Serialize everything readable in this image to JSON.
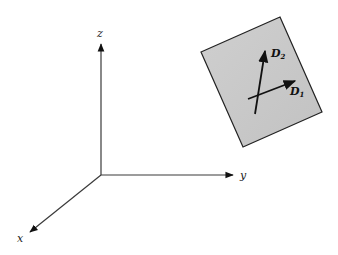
{
  "diagram": {
    "axes": {
      "x": {
        "label": "x"
      },
      "y": {
        "label": "y"
      },
      "z": {
        "label": "z"
      }
    },
    "plane": {
      "fill": "#c8c8c8",
      "edge": "#222222"
    },
    "vectors": [
      {
        "name": "D",
        "subscript": "1"
      },
      {
        "name": "D",
        "subscript": "2"
      }
    ]
  }
}
